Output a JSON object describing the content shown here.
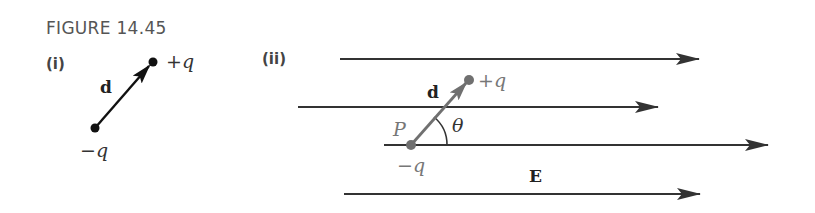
{
  "figure": {
    "title": "FIGURE 14.45",
    "panels": [
      {
        "label": "(i)",
        "dipole": {
          "vector_label": "d",
          "positive_charge": "+q",
          "negative_charge": "−q"
        }
      },
      {
        "label": "(ii)",
        "dipole": {
          "vector_label": "d",
          "positive_charge": "+q",
          "negative_charge": "−q",
          "point_label": "P",
          "angle_label": "θ"
        },
        "field_label": "E",
        "field_lines": 4
      }
    ]
  },
  "colors": {
    "line": "#333333",
    "dipole_ii": "#707070",
    "dipole_i": "#111111"
  }
}
